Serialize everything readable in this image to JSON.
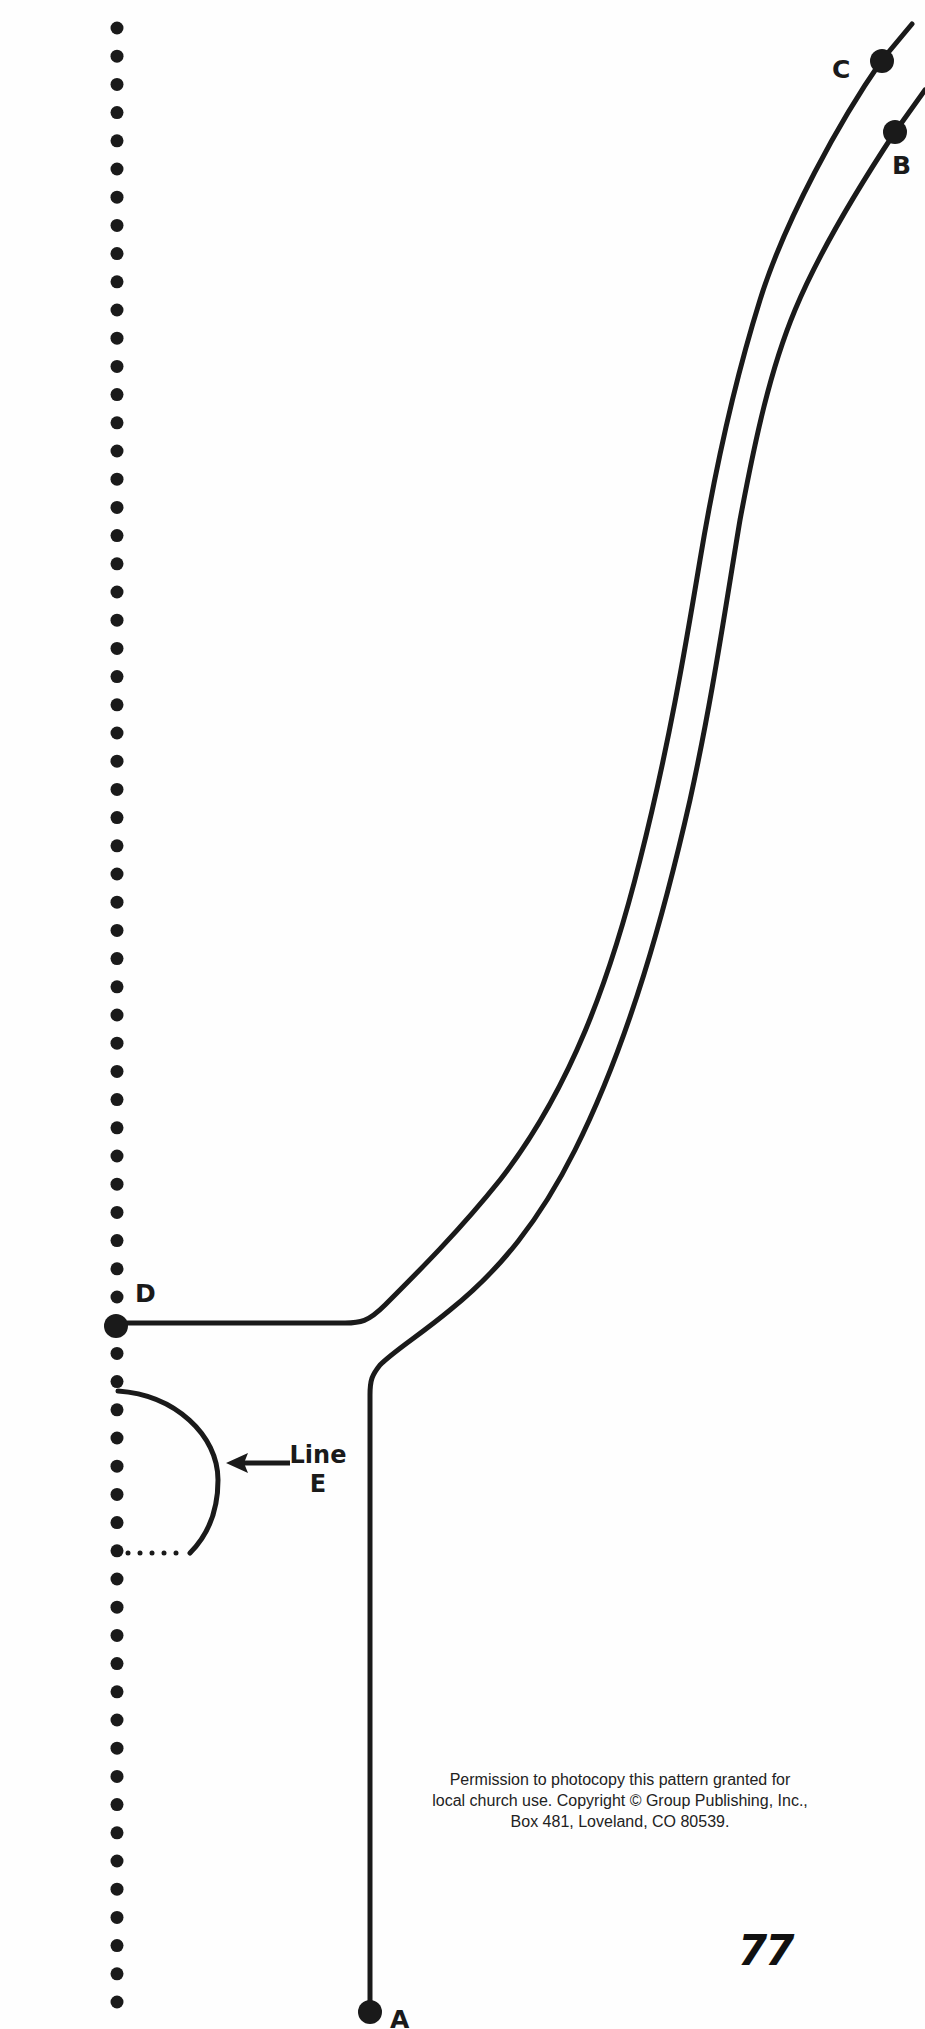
{
  "pattern": {
    "points": [
      {
        "id": "A",
        "label": "A"
      },
      {
        "id": "B",
        "label": "B"
      },
      {
        "id": "C",
        "label": "C"
      },
      {
        "id": "D",
        "label": "D"
      }
    ],
    "line_e": {
      "line1": "Line",
      "line2": "E"
    },
    "fold_line": "dotted"
  },
  "footer": {
    "notice_lines": [
      "Permission to photocopy this pattern granted for",
      "local church use. Copyright © Group Publishing, Inc.,",
      "Box 481, Loveland, CO 80539."
    ],
    "page_number": "77"
  },
  "colors": {
    "ink": "#1a1a1a",
    "paper": "#fefefe"
  }
}
